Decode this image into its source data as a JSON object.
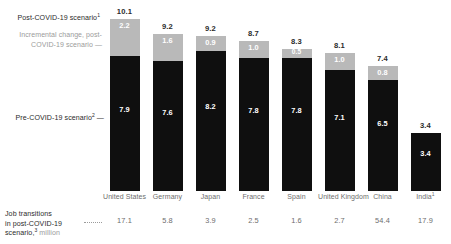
{
  "legend": {
    "post_label": "Post-COVID-19 scenario",
    "post_sup": "1",
    "incremental_label": "Incremental change, post-COVID-19 scenario —",
    "pre_label": "Pre-COVID-19 scenario",
    "pre_sup": "2",
    "dash": "—"
  },
  "footer": {
    "line1": "Job transitions",
    "line2": "in post-COVID-19",
    "line3": "scenario,",
    "sup": "3",
    "unit": " million"
  },
  "colors": {
    "pre_covid": "#0f0f0f",
    "incremental": "#b9b9b9",
    "total_text": "#2b2b2b",
    "axis_text": "#6d6d6d",
    "muted_text": "#9b9b9b",
    "background": "#ffffff"
  },
  "chart_data": {
    "type": "bar",
    "title": "",
    "subtitle": "",
    "xlabel": "",
    "ylabel": "",
    "ylim": [
      0,
      10.6
    ],
    "grid": false,
    "stacked": true,
    "legend_position": "left",
    "categories": [
      "United States",
      "Germany",
      "Japan",
      "France",
      "Spain",
      "United Kingdom",
      "China",
      "India"
    ],
    "category_sups": [
      "",
      "",
      "",
      "",
      "",
      "",
      "",
      "1"
    ],
    "series": [
      {
        "name": "Pre-COVID-19 scenario",
        "color": "#0f0f0f",
        "values": [
          7.9,
          7.6,
          8.2,
          7.8,
          7.8,
          7.1,
          6.5,
          3.4
        ]
      },
      {
        "name": "Incremental change, post-COVID-19 scenario",
        "color": "#b9b9b9",
        "values": [
          2.2,
          1.6,
          0.9,
          1.0,
          0.5,
          1.0,
          0.8,
          0.0
        ]
      }
    ],
    "totals": [
      10.1,
      9.2,
      9.2,
      8.7,
      8.3,
      8.1,
      7.4,
      3.4
    ],
    "total_labels": [
      "10.1",
      "9.2",
      "9.2",
      "8.7",
      "8.3",
      "8.1",
      "7.4",
      "3.4"
    ],
    "pre_labels": [
      "7.9",
      "7.6",
      "8.2",
      "7.8",
      "7.8",
      "7.1",
      "6.5",
      "3.4"
    ],
    "incr_labels": [
      "2.2",
      "1.6",
      "0.9",
      "1.0",
      "0.5",
      "1.0",
      "0.8",
      ""
    ],
    "job_transitions_row": {
      "label": "Job transitions in post-COVID-19 scenario, million",
      "values": [
        17.1,
        5.8,
        3.9,
        2.5,
        1.6,
        2.7,
        54.4,
        17.9
      ],
      "value_labels": [
        "17.1",
        "5.8",
        "3.9",
        "2.5",
        "1.6",
        "2.7",
        "54.4",
        "17.9"
      ]
    }
  }
}
